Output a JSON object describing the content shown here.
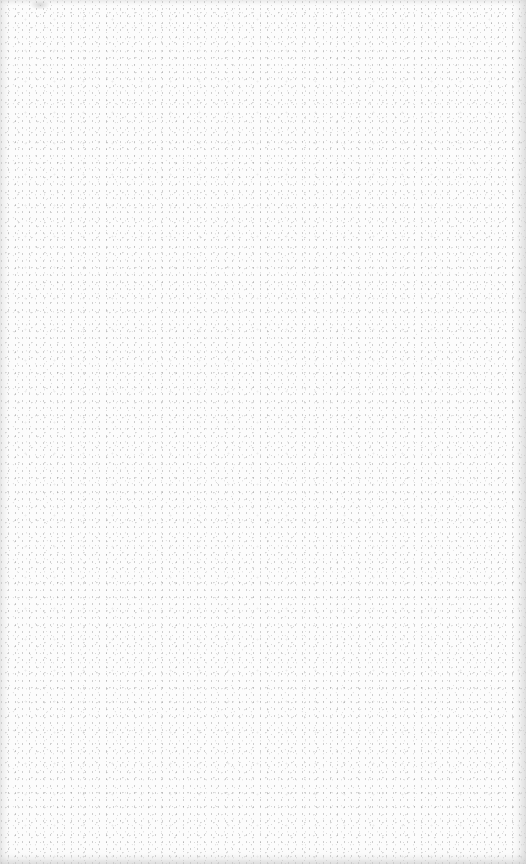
{
  "page": {
    "background_color": "#fcfcfc",
    "speckle_color": "#8c8c8c",
    "edge_shade_color": "#c8c8c8"
  }
}
